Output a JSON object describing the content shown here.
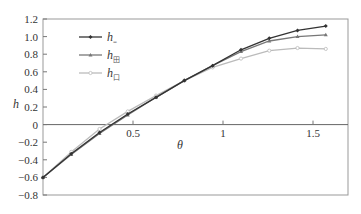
{
  "chart_data": {
    "type": "line",
    "title": "",
    "xlabel": "θ",
    "ylabel": "h",
    "xlim": [
      0,
      1.694
    ],
    "ylim": [
      -0.8,
      1.2
    ],
    "grid": false,
    "legend_position": "upper-left",
    "x_ticks": [
      0.5,
      1,
      1.5
    ],
    "x_tick_labels": [
      "0.5",
      "1",
      "1.5"
    ],
    "y_ticks": [
      1.2,
      1.0,
      0.8,
      0.6,
      0.4,
      0.2,
      0,
      -0.2,
      -0.4,
      -0.6,
      -0.8
    ],
    "y_tick_labels": [
      "1.2",
      "1.0",
      "0.8",
      "0.6",
      "0.4",
      "0.2",
      "0",
      "−0.2",
      "−0.4",
      "−0.6",
      "−0.8"
    ],
    "x": [
      0,
      0.157,
      0.314,
      0.471,
      0.628,
      0.785,
      0.942,
      1.1,
      1.257,
      1.414,
      1.571
    ],
    "series": [
      {
        "name": "h",
        "sub": "=",
        "color": "#333333",
        "marker": "diamond",
        "values": [
          -0.6,
          -0.33,
          -0.09,
          0.12,
          0.31,
          0.5,
          0.67,
          0.85,
          0.98,
          1.07,
          1.12
        ]
      },
      {
        "name": "h",
        "sub": "田",
        "color": "#777777",
        "marker": "triangle",
        "values": [
          -0.6,
          -0.34,
          -0.1,
          0.11,
          0.31,
          0.5,
          0.67,
          0.83,
          0.95,
          1.0,
          1.02
        ]
      },
      {
        "name": "h",
        "sub": "口",
        "color": "#bbbbbb",
        "marker": "circle",
        "values": [
          -0.6,
          -0.31,
          -0.05,
          0.15,
          0.33,
          0.5,
          0.65,
          0.75,
          0.84,
          0.87,
          0.86
        ]
      }
    ]
  }
}
